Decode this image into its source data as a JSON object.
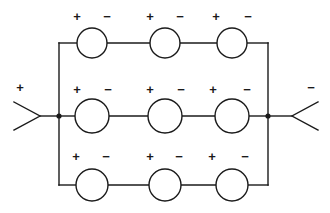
{
  "diagram": {
    "type": "circuit-schematic",
    "stroke_color": "#1a1a1a",
    "background_color": "#ffffff",
    "fill_color": "#ffffff",
    "canvas": {
      "width": 330,
      "height": 213
    },
    "geometry": {
      "left_bus_x": 59,
      "right_bus_x": 268,
      "row_y": [
        43,
        116,
        185
      ],
      "cell_center_x": [
        92,
        165,
        232
      ],
      "cell_radius_top": 15,
      "cell_radius_mid": 17,
      "cell_radius_bottom": 16,
      "junction_radius": 2.6,
      "stroke_width": 1.4
    },
    "terminals": {
      "left": {
        "name": "positive-terminal",
        "label": "+",
        "label_x": 20,
        "label_y": 88,
        "wedge_tip_x": 40,
        "wedge_back_x": 14,
        "wedge_half_height": 14,
        "wire_from_x": 40,
        "wire_to_x": 59,
        "y": 116
      },
      "right": {
        "name": "negative-terminal",
        "label": "−",
        "label_x": 311,
        "label_y": 88,
        "wedge_tip_x": 292,
        "wedge_back_x": 318,
        "wedge_half_height": 14,
        "wire_from_x": 268,
        "wire_to_x": 292,
        "y": 116
      }
    },
    "junctions": [
      {
        "name": "left-junction-dot",
        "x": 59,
        "y": 116
      },
      {
        "name": "right-junction-dot",
        "x": 268,
        "y": 116
      }
    ],
    "branches": [
      {
        "name": "top-branch",
        "row_index": 0,
        "y": 43,
        "radius": 15,
        "cells": [
          {
            "name": "cell-1",
            "cx": 92,
            "plus": "+",
            "minus": "−",
            "plus_x": 77,
            "minus_x": 107,
            "label_y": 17
          },
          {
            "name": "cell-2",
            "cx": 165,
            "plus": "+",
            "minus": "−",
            "plus_x": 150,
            "minus_x": 180,
            "label_y": 17
          },
          {
            "name": "cell-3",
            "cx": 232,
            "plus": "+",
            "minus": "−",
            "plus_x": 216,
            "minus_x": 248,
            "label_y": 17
          }
        ]
      },
      {
        "name": "middle-branch",
        "row_index": 1,
        "y": 116,
        "radius": 17,
        "cells": [
          {
            "name": "cell-4",
            "cx": 92,
            "plus": "+",
            "minus": "−",
            "plus_x": 77,
            "minus_x": 108,
            "label_y": 90
          },
          {
            "name": "cell-5",
            "cx": 165,
            "plus": "+",
            "minus": "−",
            "plus_x": 150,
            "minus_x": 181,
            "label_y": 90
          },
          {
            "name": "cell-6",
            "cx": 232,
            "plus": "+",
            "minus": "−",
            "plus_x": 213,
            "minus_x": 247,
            "label_y": 90
          }
        ]
      },
      {
        "name": "bottom-branch",
        "row_index": 2,
        "y": 185,
        "radius": 16,
        "cells": [
          {
            "name": "cell-7",
            "cx": 92,
            "plus": "+",
            "minus": "−",
            "plus_x": 76,
            "minus_x": 106,
            "label_y": 157
          },
          {
            "name": "cell-8",
            "cx": 165,
            "plus": "+",
            "minus": "−",
            "plus_x": 150,
            "minus_x": 179,
            "label_y": 157
          },
          {
            "name": "cell-9",
            "cx": 232,
            "plus": "+",
            "minus": "−",
            "plus_x": 212,
            "minus_x": 245,
            "label_y": 157
          }
        ]
      }
    ]
  }
}
